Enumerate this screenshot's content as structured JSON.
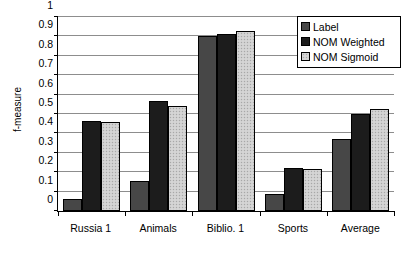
{
  "chart_data": {
    "type": "bar",
    "title": "",
    "xlabel": "",
    "ylabel": "f-measure",
    "ylim": [
      0,
      1
    ],
    "yticks": [
      "0",
      "0.1",
      "0.2",
      "0.3",
      "0.4",
      "0.5",
      "0.6",
      "0.7",
      "0.8",
      "0.9",
      "1"
    ],
    "grid": true,
    "legend_position": "top-right",
    "categories": [
      "Russia 1",
      "Animals",
      "Biblio. 1",
      "Sports",
      "Average"
    ],
    "series": [
      {
        "name": "Label",
        "color": "#474747",
        "values": [
          0.06,
          0.155,
          0.9,
          0.09,
          0.37
        ]
      },
      {
        "name": "NOM Weighted",
        "color": "#1c1c1c",
        "values": [
          0.465,
          0.565,
          0.915,
          0.22,
          0.5
        ]
      },
      {
        "name": "NOM Sigmoid",
        "color": "#cfcfcf",
        "values": [
          0.46,
          0.54,
          0.93,
          0.215,
          0.525
        ]
      }
    ]
  }
}
